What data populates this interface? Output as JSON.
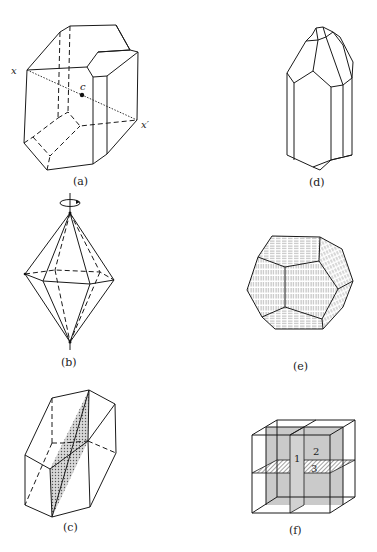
{
  "figure": {
    "panels": [
      {
        "id": "a",
        "label": "(a)",
        "points": {
          "x": "x",
          "x_prime": "x′",
          "center": "c"
        },
        "description": "Crystal with centre of symmetry c on line x–x′"
      },
      {
        "id": "b",
        "label": "(b)",
        "description": "Hexagonal bipyramid with rotation axis"
      },
      {
        "id": "c",
        "label": "(c)",
        "description": "Crystal with shaded mirror plane"
      },
      {
        "id": "d",
        "label": "(d)",
        "description": "Prismatic crystal with pyramidal termination"
      },
      {
        "id": "e",
        "label": "(e)",
        "description": "Pentagonal dodecahedron with striated faces"
      },
      {
        "id": "f",
        "label": "(f)",
        "plane_labels": [
          "1",
          "2",
          "3"
        ],
        "description": "Cube with three mutually perpendicular mirror planes"
      }
    ]
  }
}
